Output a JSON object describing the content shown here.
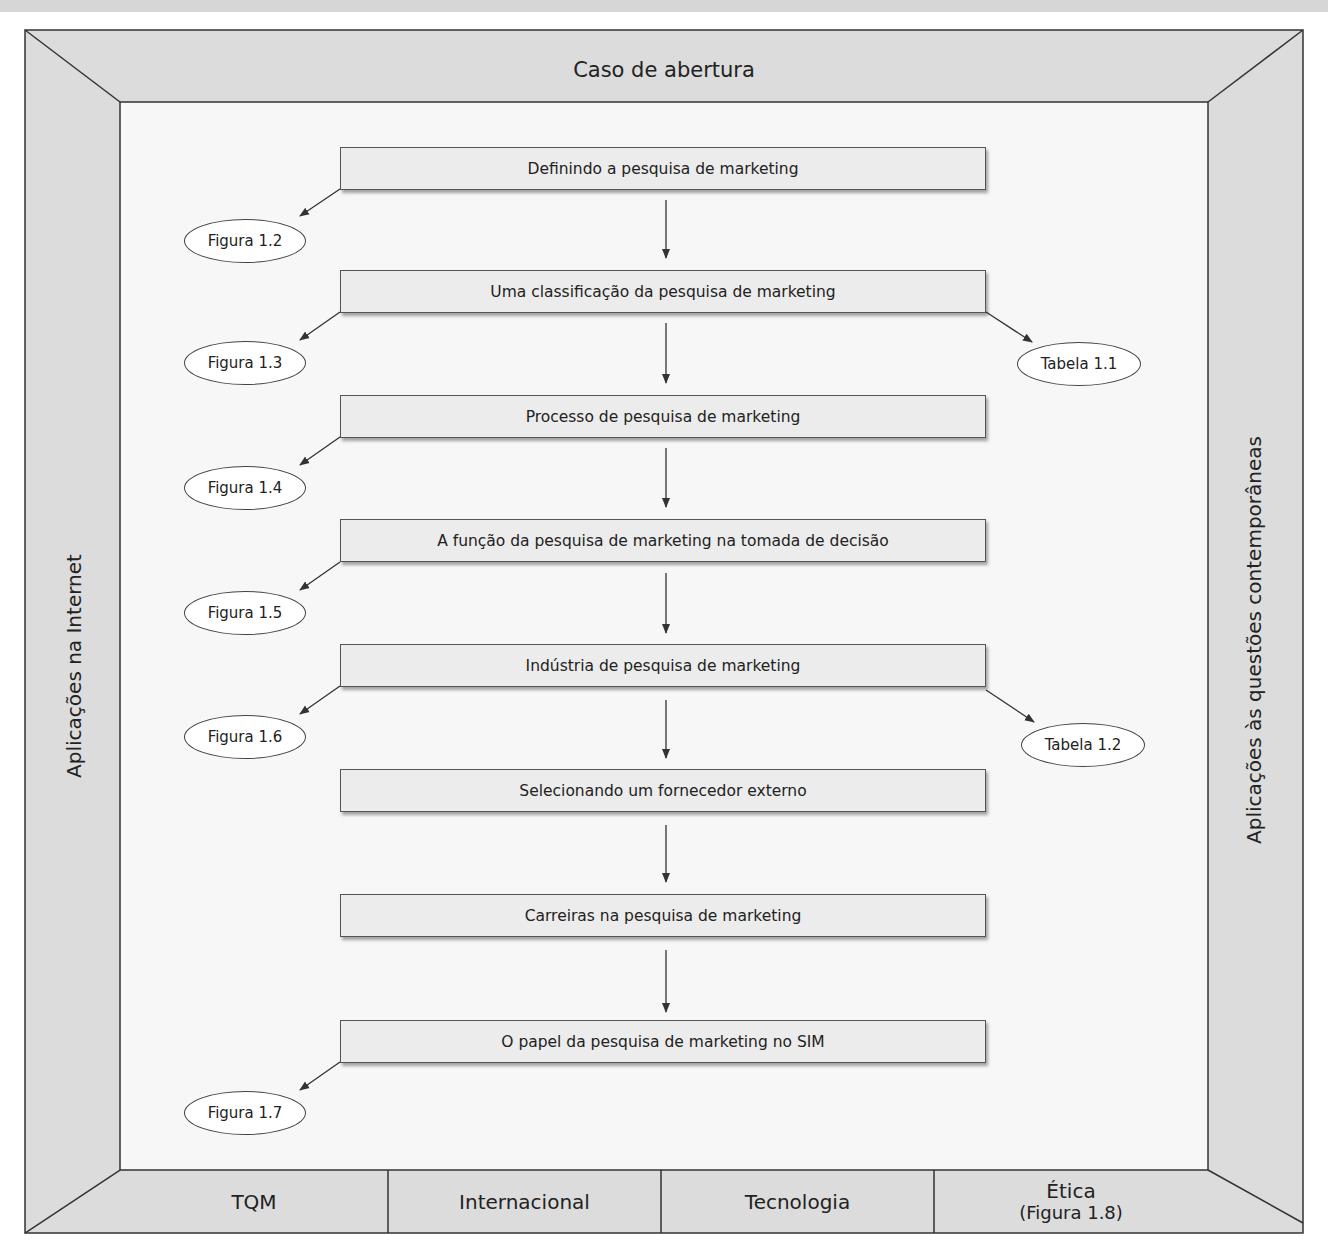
{
  "frame": {
    "top_label": "Caso de abertura",
    "left_label": "Aplicações na Internet",
    "right_label": "Aplicações às questões contemporâneas",
    "bottom_sections": [
      {
        "label": "TQM",
        "sub": ""
      },
      {
        "label": "Internacional",
        "sub": ""
      },
      {
        "label": "Tecnologia",
        "sub": ""
      },
      {
        "label": "Ética",
        "sub": "(Figura 1.8)"
      }
    ]
  },
  "flow": {
    "steps": [
      {
        "label": "Definindo a pesquisa de marketing",
        "left_ref": "Figura 1.2",
        "right_ref": ""
      },
      {
        "label": "Uma classificação da pesquisa de marketing",
        "left_ref": "Figura 1.3",
        "right_ref": "Tabela 1.1"
      },
      {
        "label": "Processo de pesquisa de marketing",
        "left_ref": "Figura 1.4",
        "right_ref": ""
      },
      {
        "label": "A função da pesquisa de marketing na tomada de decisão",
        "left_ref": "Figura 1.5",
        "right_ref": ""
      },
      {
        "label": "Indústria de pesquisa de marketing",
        "left_ref": "Figura 1.6",
        "right_ref": "Tabela 1.2"
      },
      {
        "label": "Selecionando um fornecedor externo",
        "left_ref": "",
        "right_ref": ""
      },
      {
        "label": "Carreiras na pesquisa de marketing",
        "left_ref": "",
        "right_ref": ""
      },
      {
        "label": "O papel da pesquisa de marketing no SIM",
        "left_ref": "Figura 1.7",
        "right_ref": ""
      }
    ]
  },
  "colors": {
    "frame_fill": "#dcdcdc",
    "inner_fill": "#f7f7f7",
    "box_fill": "#ececec",
    "line": "#333333"
  }
}
